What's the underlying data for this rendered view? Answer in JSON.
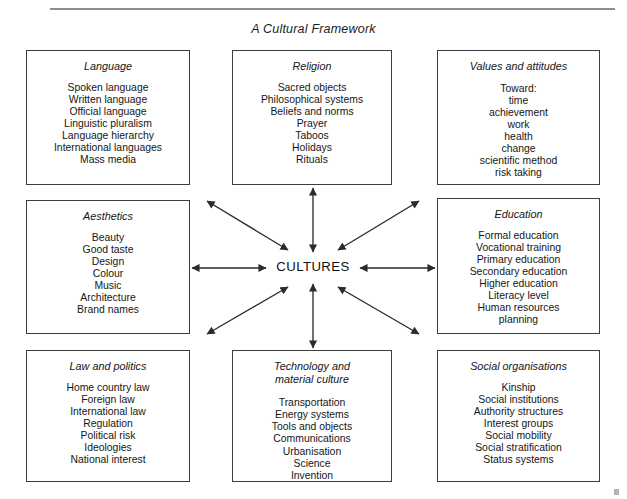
{
  "figure": {
    "title": "A Cultural Framework",
    "centre_label": "CULTURES",
    "line_color": "#3d3d3d",
    "text_color": "#161616",
    "background": "#ffffff"
  },
  "boxes": {
    "language": {
      "title": "Language",
      "items": [
        "Spoken language",
        "Written language",
        "Official language",
        "Linguistic pluralism",
        "Language hierarchy",
        "International languages",
        "Mass media"
      ]
    },
    "religion": {
      "title": "Religion",
      "items": [
        "Sacred objects",
        "Philosophical systems",
        "Beliefs and norms",
        "Prayer",
        "Taboos",
        "Holidays",
        "Rituals"
      ]
    },
    "values": {
      "title": "Values and attitudes",
      "items": [
        "Toward:",
        "time",
        "achievement",
        "work",
        "health",
        "change",
        "scientific method",
        "risk taking"
      ]
    },
    "aesthetics": {
      "title": "Aesthetics",
      "items": [
        "Beauty",
        "Good taste",
        "Design",
        "Colour",
        "Music",
        "Architecture",
        "Brand names"
      ]
    },
    "education": {
      "title": "Education",
      "items": [
        "Formal education",
        "Vocational training",
        "Primary education",
        "Secondary education",
        "Higher education",
        "Literacy level",
        "Human resources",
        "planning"
      ]
    },
    "law": {
      "title": "Law and politics",
      "items": [
        "Home country law",
        "Foreign law",
        "International law",
        "Regulation",
        "Political risk",
        "Ideologies",
        "National interest"
      ]
    },
    "technology": {
      "title": "Technology and\nmaterial culture",
      "items": [
        "Transportation",
        "Energy systems",
        "Tools and objects",
        "Communications",
        "Urbanisation",
        "Science",
        "Invention"
      ]
    },
    "social": {
      "title": "Social organisations",
      "items": [
        "Kinship",
        "Social institutions",
        "Authority structures",
        "Interest groups",
        "Social mobility",
        "Social stratification",
        "Status systems"
      ]
    }
  },
  "connectors": [
    {
      "name": "arrow-centre-to-language",
      "x1": 207,
      "y1": 201,
      "x2": 288,
      "y2": 250
    },
    {
      "name": "arrow-centre-to-religion",
      "x1": 313,
      "y1": 188,
      "x2": 313,
      "y2": 252
    },
    {
      "name": "arrow-centre-to-values",
      "x1": 419,
      "y1": 201,
      "x2": 338,
      "y2": 250
    },
    {
      "name": "arrow-centre-to-aesthetics",
      "x1": 192,
      "y1": 268,
      "x2": 266,
      "y2": 268
    },
    {
      "name": "arrow-centre-to-education",
      "x1": 435,
      "y1": 268,
      "x2": 360,
      "y2": 268
    },
    {
      "name": "arrow-centre-to-law",
      "x1": 207,
      "y1": 334,
      "x2": 288,
      "y2": 287
    },
    {
      "name": "arrow-centre-to-technology",
      "x1": 313,
      "y1": 348,
      "x2": 313,
      "y2": 284
    },
    {
      "name": "arrow-centre-to-social",
      "x1": 419,
      "y1": 334,
      "x2": 338,
      "y2": 287
    }
  ]
}
